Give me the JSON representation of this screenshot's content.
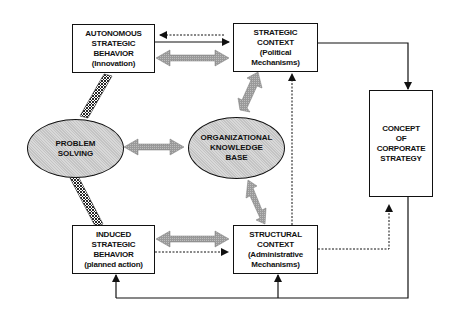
{
  "diagram": {
    "nodes": {
      "autonomous": {
        "line1": "AUTONOMOUS",
        "line2": "STRATEGIC",
        "line3": "BEHAVIOR",
        "line4": "(Innovation)"
      },
      "strategic_context": {
        "line1": "STRATEGIC",
        "line2": "CONTEXT",
        "line3": "(Political",
        "line4": "Mechanisms)"
      },
      "problem_solving": {
        "line1": "PROBLEM",
        "line2": "SOLVING"
      },
      "org_knowledge": {
        "line1": "ORGANIZATIONAL",
        "line2": "KNOWLEDGE",
        "line3": "BASE"
      },
      "corporate_strategy": {
        "line1": "CONCEPT",
        "line2": "OF",
        "line3": "CORPORATE",
        "line4": "STRATEGY"
      },
      "induced": {
        "line1": "INDUCED",
        "line2": "STRATEGIC",
        "line3": "BEHAVIOR",
        "line4": "(planned action)"
      },
      "structural_context": {
        "line1": "STRUCTURAL",
        "line2": "CONTEXT",
        "line3": "(Administrative",
        "line4": "Mechanisms)"
      }
    },
    "edges": [
      {
        "from": "autonomous",
        "to": "strategic_context",
        "style": "solid-arrow"
      },
      {
        "from": "strategic_context",
        "to": "autonomous",
        "style": "dashed-arrow"
      },
      {
        "from": "autonomous",
        "to": "strategic_context",
        "style": "gray-double-arrow"
      },
      {
        "from": "autonomous",
        "to": "problem_solving",
        "style": "crosshatch-link"
      },
      {
        "from": "problem_solving",
        "to": "induced",
        "style": "crosshatch-link"
      },
      {
        "from": "problem_solving",
        "to": "org_knowledge",
        "style": "gray-double-arrow"
      },
      {
        "from": "org_knowledge",
        "to": "strategic_context",
        "style": "gray-double-arrow"
      },
      {
        "from": "org_knowledge",
        "to": "structural_context",
        "style": "gray-double-arrow"
      },
      {
        "from": "induced",
        "to": "structural_context",
        "style": "gray-double-arrow"
      },
      {
        "from": "induced",
        "to": "structural_context",
        "style": "dashed-arrow"
      },
      {
        "from": "structural_context",
        "to": "strategic_context",
        "style": "dashed-arrow"
      },
      {
        "from": "structural_context",
        "to": "corporate_strategy",
        "style": "dashed-arrow"
      },
      {
        "from": "strategic_context",
        "to": "corporate_strategy",
        "style": "solid-arrow"
      },
      {
        "from": "corporate_strategy",
        "to": "induced",
        "style": "solid-arrow"
      },
      {
        "from": "corporate_strategy",
        "to": "structural_context",
        "style": "solid-arrow"
      }
    ]
  }
}
